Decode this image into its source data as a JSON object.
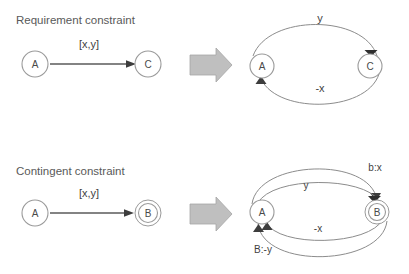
{
  "figure": {
    "background_color": "#ffffff",
    "node_stroke_color": "#9a9a9a",
    "edge_color": "#5a5a5a",
    "arc_color": "#8c8c8c",
    "block_arrow_color": "#bfbfbf",
    "text_color": "#595959"
  },
  "sections": [
    {
      "id": "requirement",
      "title": "Requirement constraint",
      "left": {
        "nodes": [
          {
            "id": "A",
            "label": "A",
            "type": "single"
          },
          {
            "id": "C",
            "label": "C",
            "type": "single"
          }
        ],
        "edges": [
          {
            "from": "A",
            "to": "C",
            "label": "[x,y]",
            "style": "straight"
          }
        ]
      },
      "right": {
        "nodes": [
          {
            "id": "A",
            "label": "A",
            "type": "single"
          },
          {
            "id": "C",
            "label": "C",
            "type": "single"
          }
        ],
        "edges": [
          {
            "from": "A",
            "to": "C",
            "label": "y",
            "style": "arc-top"
          },
          {
            "from": "C",
            "to": "A",
            "label": "-x",
            "style": "arc-bottom"
          }
        ]
      }
    },
    {
      "id": "contingent",
      "title": "Contingent constraint",
      "left": {
        "nodes": [
          {
            "id": "A",
            "label": "A",
            "type": "single"
          },
          {
            "id": "B",
            "label": "B",
            "type": "double"
          }
        ],
        "edges": [
          {
            "from": "A",
            "to": "B",
            "label": "[x,y]",
            "style": "straight"
          }
        ]
      },
      "right": {
        "nodes": [
          {
            "id": "A",
            "label": "A",
            "type": "single"
          },
          {
            "id": "B",
            "label": "B",
            "type": "double"
          }
        ],
        "edges": [
          {
            "from": "A",
            "to": "B",
            "label": "b:x",
            "style": "arc-top-outer"
          },
          {
            "from": "A",
            "to": "B",
            "label": "y",
            "style": "arc-top-inner"
          },
          {
            "from": "B",
            "to": "A",
            "label": "-x",
            "style": "arc-bottom-inner"
          },
          {
            "from": "B",
            "to": "A",
            "label": "B:-y",
            "style": "arc-bottom-outer"
          }
        ]
      }
    }
  ],
  "transform_arrows": [
    {
      "id": "top",
      "name": "block-arrow-requirement"
    },
    {
      "id": "bottom",
      "name": "block-arrow-contingent"
    }
  ]
}
